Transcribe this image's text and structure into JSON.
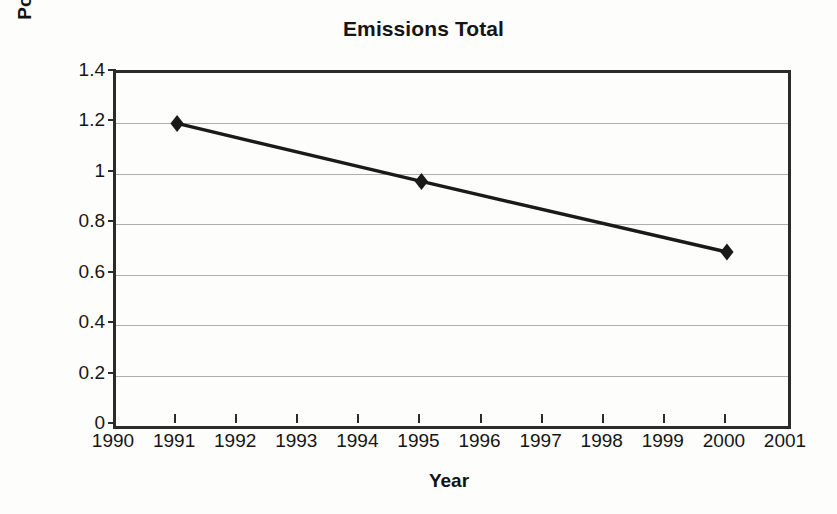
{
  "chart_data": {
    "type": "line",
    "title": "Emissions Total",
    "xlabel": "Year",
    "ylabel": "Pounds (in billions)",
    "x": [
      1991,
      1995,
      2000
    ],
    "values": [
      1.2,
      0.97,
      0.69
    ],
    "series": [
      {
        "name": "Emissions Total",
        "x": [
          1991,
          1995,
          2000
        ],
        "values": [
          1.2,
          0.97,
          0.69
        ],
        "color": "#1a1a1a",
        "marker": "diamond"
      }
    ],
    "xlim": [
      1990,
      2001
    ],
    "ylim": [
      0,
      1.4
    ],
    "xticks": [
      1990,
      1991,
      1992,
      1993,
      1994,
      1995,
      1996,
      1997,
      1998,
      1999,
      2000,
      2001
    ],
    "xtick_labels": [
      "1990",
      "1991",
      "1992",
      "1993",
      "1994",
      "1995",
      "1996",
      "1997",
      "1998",
      "1999",
      "2000",
      "2001"
    ],
    "yticks": [
      0,
      0.2,
      0.4,
      0.6,
      0.8,
      1,
      1.2,
      1.4
    ],
    "ytick_labels": [
      "0",
      "0.2",
      "0.4",
      "0.6",
      "0.8",
      "1",
      "1.2",
      "1.4"
    ],
    "grid": "horizontal",
    "legend": "none",
    "gridline_color": "#aeaeae",
    "axis_color": "#2b2b2b",
    "background_color": "#fdfdfc"
  }
}
